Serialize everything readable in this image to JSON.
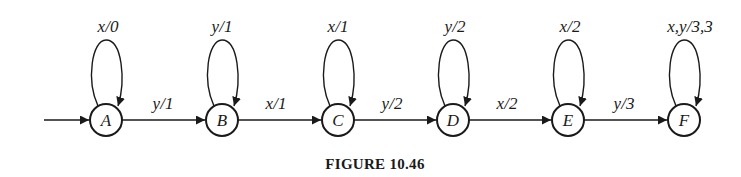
{
  "diagram": {
    "type": "state-machine",
    "caption": "FIGURE 10.46",
    "start_state": "A",
    "states": [
      {
        "id": "A",
        "label": "A",
        "cx": 106,
        "cy": 120
      },
      {
        "id": "B",
        "label": "B",
        "cx": 222,
        "cy": 120
      },
      {
        "id": "C",
        "label": "C",
        "cx": 338,
        "cy": 120
      },
      {
        "id": "D",
        "label": "D",
        "cx": 453,
        "cy": 120
      },
      {
        "id": "E",
        "label": "E",
        "cx": 568,
        "cy": 120
      },
      {
        "id": "F",
        "label": "F",
        "cx": 684,
        "cy": 120
      }
    ],
    "self_loops": [
      {
        "state": "A",
        "input": "x",
        "output": "0",
        "label": "x/0"
      },
      {
        "state": "B",
        "input": "y",
        "output": "1",
        "label": "y/1"
      },
      {
        "state": "C",
        "input": "x",
        "output": "1",
        "label": "x/1"
      },
      {
        "state": "D",
        "input": "y",
        "output": "2",
        "label": "y/2"
      },
      {
        "state": "E",
        "input": "x",
        "output": "2",
        "label": "x/2"
      },
      {
        "state": "F",
        "input": "x,y",
        "output": "3,3",
        "label": "x,y/3,3"
      }
    ],
    "transitions": [
      {
        "from": "A",
        "to": "B",
        "input": "y",
        "output": "1",
        "label": "y/1"
      },
      {
        "from": "B",
        "to": "C",
        "input": "x",
        "output": "1",
        "label": "x/1"
      },
      {
        "from": "C",
        "to": "D",
        "input": "y",
        "output": "2",
        "label": "y/2"
      },
      {
        "from": "D",
        "to": "E",
        "input": "x",
        "output": "2",
        "label": "x/2"
      },
      {
        "from": "E",
        "to": "F",
        "input": "y",
        "output": "3",
        "label": "y/3"
      }
    ],
    "colors": {
      "stroke": "#1a1a1a",
      "background": "#ffffff"
    }
  }
}
